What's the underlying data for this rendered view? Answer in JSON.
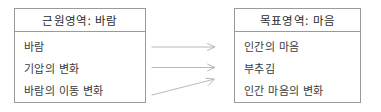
{
  "diagram": {
    "type": "conceptual-metaphor-mapping",
    "source_domain": {
      "header": "근원영역: 바람",
      "items": [
        {
          "label": "바람"
        },
        {
          "label": "기압의 변화"
        },
        {
          "label": "바람의 이동 변화"
        }
      ]
    },
    "target_domain": {
      "header": "목표영역: 마음",
      "items": [
        {
          "label": "인간의 마음"
        },
        {
          "label": "부추김"
        },
        {
          "label": "인간 마음의 변화"
        }
      ]
    },
    "mappings": [
      {
        "name": "mapping-arrow-1",
        "from": "바람",
        "to": "인간의 마음",
        "style": "straight"
      },
      {
        "name": "mapping-arrow-2",
        "from": "기압의 변화",
        "to": "부추김",
        "style": "straight"
      },
      {
        "name": "mapping-arrow-3",
        "from": "바람의 이동 변화",
        "to": "인간 마음의 변화",
        "style": "diagonal-up"
      }
    ],
    "colors": {
      "border": "#9a9a9a",
      "text": "#3a3a3a",
      "header_text": "#2b2b2b",
      "arrow": "#b0b0b0",
      "background": "#ffffff"
    }
  }
}
